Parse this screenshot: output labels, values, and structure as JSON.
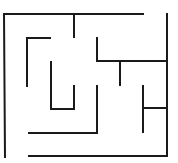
{
  "maze": {
    "width": 178,
    "height": 163,
    "stroke_color": "#1a1a1a",
    "stroke_width": 2,
    "walls": [
      {
        "x1": 4,
        "y1": 14,
        "x2": 143,
        "y2": 14
      },
      {
        "x1": 4,
        "y1": 14,
        "x2": 5,
        "y2": 157
      },
      {
        "x1": 74,
        "y1": 14,
        "x2": 74,
        "y2": 37
      },
      {
        "x1": 167,
        "y1": 14,
        "x2": 167,
        "y2": 156
      },
      {
        "x1": 27,
        "y1": 38,
        "x2": 50,
        "y2": 38
      },
      {
        "x1": 27,
        "y1": 38,
        "x2": 27,
        "y2": 86
      },
      {
        "x1": 97,
        "y1": 38,
        "x2": 97,
        "y2": 61
      },
      {
        "x1": 97,
        "y1": 61,
        "x2": 167,
        "y2": 61
      },
      {
        "x1": 120,
        "y1": 61,
        "x2": 120,
        "y2": 85
      },
      {
        "x1": 51,
        "y1": 62,
        "x2": 51,
        "y2": 109
      },
      {
        "x1": 51,
        "y1": 109,
        "x2": 74,
        "y2": 109
      },
      {
        "x1": 74,
        "y1": 86,
        "x2": 74,
        "y2": 109
      },
      {
        "x1": 97,
        "y1": 86,
        "x2": 97,
        "y2": 133
      },
      {
        "x1": 29,
        "y1": 133,
        "x2": 97,
        "y2": 133
      },
      {
        "x1": 143,
        "y1": 86,
        "x2": 143,
        "y2": 132
      },
      {
        "x1": 143,
        "y1": 108,
        "x2": 167,
        "y2": 108
      },
      {
        "x1": 29,
        "y1": 156,
        "x2": 167,
        "y2": 156
      }
    ]
  }
}
